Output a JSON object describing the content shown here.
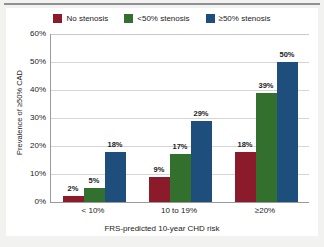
{
  "chart_data": {
    "type": "bar",
    "title": "",
    "subtitle": "",
    "xlabel": "FRS-predicted 10-year CHD risk",
    "ylabel": "Prevalence of ≥50% CAD",
    "categories": [
      "< 10%",
      "10 to 19%",
      "≥20%"
    ],
    "series": [
      {
        "name": "No stenosis",
        "color": "#8b1b2b",
        "values": [
          2,
          9,
          18
        ],
        "labels": [
          "2%",
          "9%",
          "18%"
        ]
      },
      {
        "name": "<50% stenosis",
        "color": "#33702e",
        "values": [
          5,
          17,
          39
        ],
        "labels": [
          "5%",
          "17%",
          "39%"
        ]
      },
      {
        "name": "≥50% stenosis",
        "color": "#1d4e7c",
        "values": [
          18,
          29,
          50
        ],
        "labels": [
          "18%",
          "29%",
          "50%"
        ]
      }
    ],
    "ylim": [
      0,
      60
    ],
    "ytick_values": [
      0,
      10,
      20,
      30,
      40,
      50,
      60
    ],
    "ytick_labels": [
      "0%",
      "10%",
      "20%",
      "30%",
      "40%",
      "50%",
      "60%"
    ],
    "grid": true,
    "legend_position": "top-center",
    "value_labels": true
  },
  "legend": {
    "entries": [
      {
        "label": "No stenosis"
      },
      {
        "label": "<50% stenosis"
      },
      {
        "label": "≥50% stenosis"
      }
    ]
  }
}
